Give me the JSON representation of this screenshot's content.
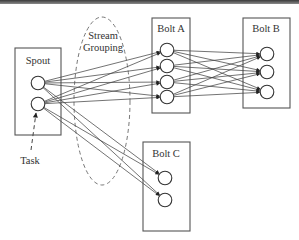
{
  "diagram": {
    "title": "",
    "components": [
      {
        "id": "spout",
        "label": "Spout",
        "tasks": 2
      },
      {
        "id": "bolt_a",
        "label": "Bolt A",
        "tasks": 4
      },
      {
        "id": "bolt_b",
        "label": "Bolt B",
        "tasks": 3
      },
      {
        "id": "bolt_c",
        "label": "Bolt C",
        "tasks": 2
      }
    ],
    "connections": [
      {
        "from": "spout",
        "to": "bolt_a",
        "pattern": "all-to-all"
      },
      {
        "from": "spout",
        "to": "bolt_c",
        "pattern": "all-to-all"
      },
      {
        "from": "bolt_a",
        "to": "bolt_b",
        "pattern": "all-to-all"
      }
    ],
    "annotations": {
      "stream_grouping_line1": "Stream",
      "stream_grouping_line2": "Grouping",
      "task": "Task"
    }
  }
}
